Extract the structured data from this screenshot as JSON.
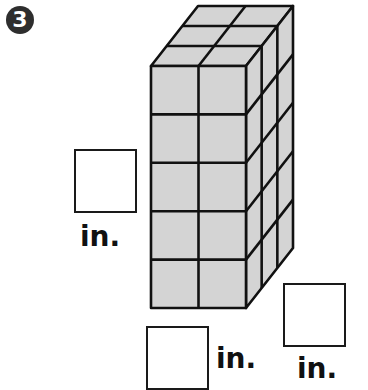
{
  "problem": {
    "number": "3",
    "prism": {
      "cubes_wide": 2,
      "cubes_tall": 5,
      "cubes_deep": 3,
      "face_color": "#d4d4d4",
      "edge_color": "#111111"
    },
    "answers": [
      {
        "id": "height",
        "value": "",
        "unit": "in."
      },
      {
        "id": "width",
        "value": "",
        "unit": "in."
      },
      {
        "id": "depth",
        "value": "",
        "unit": "in."
      }
    ]
  }
}
